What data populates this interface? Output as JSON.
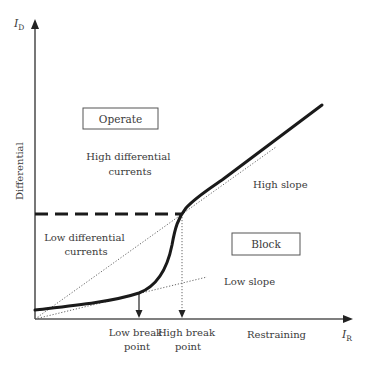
{
  "diagram": {
    "type": "differential-relay-characteristic",
    "colors": {
      "curve": "#1a1a1a",
      "axis": "#555555",
      "dotted": "#555555",
      "text": "#3a3a3a",
      "box_border": "#555555"
    },
    "axes": {
      "y_symbol": "I",
      "y_subscript": "D",
      "y_label": "Differential",
      "x_symbol": "I",
      "x_subscript": "R",
      "x_label": "Restraining"
    },
    "regions": {
      "operate_box": "Operate",
      "block_box": "Block"
    },
    "annotations": {
      "high_diff_line1": "High differential",
      "high_diff_line2": "currents",
      "low_diff_line1": "Low differential",
      "low_diff_line2": "currents",
      "high_slope": "High slope",
      "low_slope": "Low slope",
      "low_break_line1": "Low break",
      "low_break_line2": "point",
      "high_break_line1": "High break",
      "high_break_line2": "point"
    }
  }
}
